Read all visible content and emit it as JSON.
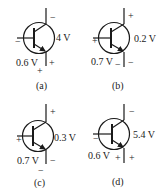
{
  "diagram": {
    "type": "bjt-transistor-bias-set",
    "stroke_color": "#1a1a1a",
    "background": "#ffffff",
    "panels": [
      {
        "id": "a",
        "caption": "(a)",
        "transistor_type": "npn",
        "vbe_label": "0.6 V",
        "vce_label": "4 V",
        "base_sign": "−",
        "collector_sign": "−",
        "emitter_sign": "+",
        "vbe_emitter_sign": "+"
      },
      {
        "id": "b",
        "caption": "(b)",
        "transistor_type": "npn",
        "vbe_label": "0.7 V",
        "vce_label": "0.2 V",
        "base_sign": "+",
        "collector_sign": "+",
        "emitter_sign": "−",
        "vbe_emitter_sign": "−"
      },
      {
        "id": "c",
        "caption": "(c)",
        "transistor_type": "npn",
        "vbe_label": "0.7 V",
        "vce_label": "0.3 V",
        "base_sign": "+",
        "collector_sign": "+",
        "emitter_sign": "−",
        "vbe_emitter_sign": "−"
      },
      {
        "id": "d",
        "caption": "(d)",
        "transistor_type": "npn",
        "vbe_label": "0.6 V",
        "vce_label": "5.4 V",
        "base_sign": "−",
        "collector_sign": "−",
        "emitter_sign": "+",
        "vbe_emitter_sign": "+"
      }
    ]
  }
}
